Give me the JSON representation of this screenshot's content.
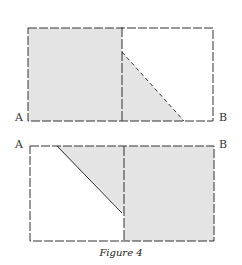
{
  "figure": {
    "caption": "Figure 4",
    "top_panel": {
      "label_left": "A",
      "label_right": "B"
    },
    "bottom_panel": {
      "label_left": "A",
      "label_right": "B"
    },
    "colors": {
      "shade": "#e4e4e4",
      "line": "#333333"
    }
  }
}
